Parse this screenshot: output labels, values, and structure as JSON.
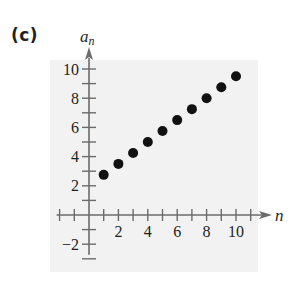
{
  "figure": {
    "panel_label": "(c)",
    "ylabel": "a",
    "ylabel_subscript": "n",
    "xlabel": "n"
  },
  "colors": {
    "background_panel": "#f2f2f2",
    "axis": "#6b6b6b",
    "points": "#111111",
    "text": "#231f20"
  },
  "chart_data": {
    "type": "scatter",
    "title": "(c)",
    "xlabel": "n",
    "ylabel": "a_n",
    "x": [
      1,
      2,
      3,
      4,
      5,
      6,
      7,
      8,
      9,
      10
    ],
    "y": [
      2.75,
      3.5,
      4.25,
      5.0,
      5.75,
      6.5,
      7.25,
      8.0,
      8.75,
      9.5
    ],
    "series": [
      {
        "name": "a_n",
        "x": [
          1,
          2,
          3,
          4,
          5,
          6,
          7,
          8,
          9,
          10
        ],
        "values": [
          2.75,
          3.5,
          4.25,
          5.0,
          5.75,
          6.5,
          7.25,
          8.0,
          8.75,
          9.5
        ]
      }
    ],
    "xticks": [
      2,
      4,
      6,
      8,
      10
    ],
    "yticks": [
      -2,
      2,
      4,
      6,
      8,
      10
    ],
    "xtick_labels": [
      "2",
      "4",
      "6",
      "8",
      "10"
    ],
    "ytick_labels": [
      "−2",
      "2",
      "4",
      "6",
      "8",
      "10"
    ],
    "xlim": [
      -2,
      11
    ],
    "ylim": [
      -3,
      10
    ],
    "minor_tick_step": 1,
    "grid": false,
    "legend": null
  }
}
